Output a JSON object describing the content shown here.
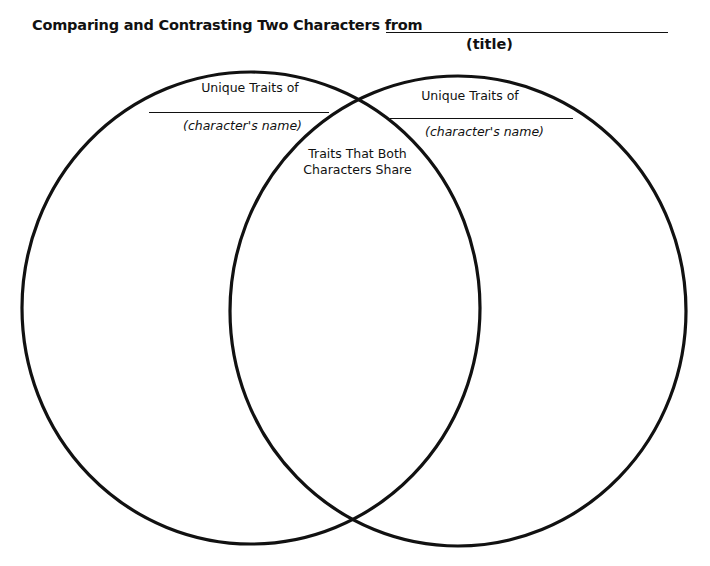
{
  "header": {
    "title": "Comparing and Contrasting Two Characters from",
    "title_blank_caption": "(title)"
  },
  "venn": {
    "left": {
      "heading": "Unique Traits of",
      "name_caption": "(character's name)"
    },
    "right": {
      "heading": "Unique Traits of",
      "name_caption": "(character's name)"
    },
    "overlap": {
      "line1": "Traits That Both",
      "line2": "Characters Share"
    },
    "stroke_color": "#111111"
  }
}
